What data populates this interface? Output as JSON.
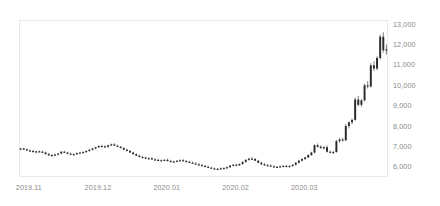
{
  "chart_data": {
    "type": "candlestick",
    "title": "",
    "subtitle": "",
    "xlabel": "",
    "ylabel": "",
    "grid": false,
    "legend": "none",
    "ylim": [
      5500,
      13200
    ],
    "y_ticks": [
      6000,
      7000,
      8000,
      9000,
      10000,
      11000,
      12000,
      13000
    ],
    "y_tick_labels": [
      "6,000",
      "7,000",
      "8,000",
      "9,000",
      "10,000",
      "11,000",
      "12,000",
      "13,000"
    ],
    "y_axis_position": "right",
    "x_tick_labels": [
      "2019.11",
      "2019.12",
      "2020.01",
      "2020.02",
      "2020.03"
    ],
    "x_tick_indices": [
      2,
      24,
      46,
      68,
      90
    ],
    "series_name": "price",
    "candle_color": "#2b2b2b",
    "background_color": "#ffffff",
    "border_color": "#e8e8e8",
    "tick_label_color": "#8a8a8a",
    "ohlc": [
      [
        6870,
        6920,
        6810,
        6900
      ],
      [
        6900,
        6940,
        6830,
        6860
      ],
      [
        6860,
        6890,
        6780,
        6800
      ],
      [
        6800,
        6850,
        6740,
        6780
      ],
      [
        6780,
        6820,
        6700,
        6720
      ],
      [
        6720,
        6780,
        6660,
        6760
      ],
      [
        6760,
        6800,
        6700,
        6740
      ],
      [
        6740,
        6790,
        6680,
        6700
      ],
      [
        6700,
        6740,
        6600,
        6620
      ],
      [
        6620,
        6680,
        6540,
        6560
      ],
      [
        6560,
        6620,
        6500,
        6580
      ],
      [
        6580,
        6650,
        6520,
        6600
      ],
      [
        6600,
        6680,
        6560,
        6650
      ],
      [
        6650,
        6760,
        6620,
        6740
      ],
      [
        6740,
        6790,
        6680,
        6700
      ],
      [
        6700,
        6740,
        6620,
        6640
      ],
      [
        6640,
        6700,
        6580,
        6600
      ],
      [
        6600,
        6660,
        6560,
        6620
      ],
      [
        6620,
        6700,
        6580,
        6680
      ],
      [
        6680,
        6740,
        6640,
        6700
      ],
      [
        6700,
        6760,
        6660,
        6720
      ],
      [
        6720,
        6800,
        6680,
        6780
      ],
      [
        6780,
        6860,
        6740,
        6840
      ],
      [
        6840,
        6920,
        6800,
        6900
      ],
      [
        6900,
        6980,
        6860,
        6960
      ],
      [
        6960,
        7060,
        6920,
        7020
      ],
      [
        7020,
        7080,
        6960,
        7000
      ],
      [
        7000,
        7060,
        6940,
        6980
      ],
      [
        6980,
        7080,
        6940,
        7060
      ],
      [
        7060,
        7140,
        7020,
        7100
      ],
      [
        7100,
        7160,
        7020,
        7040
      ],
      [
        7040,
        7080,
        6960,
        6980
      ],
      [
        6980,
        7020,
        6900,
        6920
      ],
      [
        6920,
        6960,
        6820,
        6840
      ],
      [
        6840,
        6880,
        6760,
        6780
      ],
      [
        6780,
        6820,
        6680,
        6700
      ],
      [
        6700,
        6740,
        6600,
        6620
      ],
      [
        6620,
        6660,
        6520,
        6540
      ],
      [
        6540,
        6600,
        6460,
        6480
      ],
      [
        6480,
        6540,
        6420,
        6460
      ],
      [
        6460,
        6500,
        6380,
        6400
      ],
      [
        6400,
        6460,
        6360,
        6420
      ],
      [
        6420,
        6460,
        6340,
        6360
      ],
      [
        6360,
        6420,
        6300,
        6340
      ],
      [
        6340,
        6400,
        6280,
        6300
      ],
      [
        6300,
        6360,
        6260,
        6320
      ],
      [
        6320,
        6380,
        6280,
        6340
      ],
      [
        6340,
        6400,
        6260,
        6280
      ],
      [
        6280,
        6340,
        6220,
        6240
      ],
      [
        6240,
        6300,
        6200,
        6260
      ],
      [
        6260,
        6320,
        6220,
        6300
      ],
      [
        6300,
        6360,
        6260,
        6320
      ],
      [
        6320,
        6380,
        6260,
        6280
      ],
      [
        6280,
        6340,
        6220,
        6240
      ],
      [
        6240,
        6300,
        6180,
        6200
      ],
      [
        6200,
        6260,
        6140,
        6160
      ],
      [
        6160,
        6220,
        6100,
        6120
      ],
      [
        6120,
        6180,
        6060,
        6080
      ],
      [
        6080,
        6140,
        6020,
        6040
      ],
      [
        6040,
        6100,
        5980,
        6000
      ],
      [
        6000,
        6060,
        5940,
        5960
      ],
      [
        5960,
        6000,
        5900,
        5920
      ],
      [
        5920,
        5960,
        5860,
        5880
      ],
      [
        5880,
        5940,
        5840,
        5900
      ],
      [
        5900,
        5960,
        5860,
        5920
      ],
      [
        5920,
        5980,
        5880,
        5940
      ],
      [
        5940,
        6020,
        5900,
        5980
      ],
      [
        5980,
        6080,
        5940,
        6060
      ],
      [
        6060,
        6140,
        6020,
        6100
      ],
      [
        6100,
        6160,
        6040,
        6080
      ],
      [
        6080,
        6160,
        6040,
        6140
      ],
      [
        6140,
        6260,
        6100,
        6240
      ],
      [
        6240,
        6360,
        6200,
        6340
      ],
      [
        6340,
        6440,
        6300,
        6400
      ],
      [
        6400,
        6480,
        6340,
        6380
      ],
      [
        6380,
        6440,
        6280,
        6300
      ],
      [
        6300,
        6340,
        6180,
        6200
      ],
      [
        6200,
        6240,
        6100,
        6120
      ],
      [
        6120,
        6180,
        6060,
        6080
      ],
      [
        6080,
        6140,
        6020,
        6060
      ],
      [
        6060,
        6120,
        6000,
        6020
      ],
      [
        6020,
        6080,
        5960,
        5980
      ],
      [
        5980,
        6040,
        5940,
        6000
      ],
      [
        6000,
        6060,
        5960,
        6020
      ],
      [
        6020,
        6080,
        5980,
        6040
      ],
      [
        6040,
        6100,
        5980,
        6000
      ],
      [
        6000,
        6080,
        5960,
        6040
      ],
      [
        6040,
        6140,
        6000,
        6100
      ],
      [
        6100,
        6240,
        6060,
        6200
      ],
      [
        6200,
        6340,
        6160,
        6300
      ],
      [
        6300,
        6420,
        6260,
        6380
      ],
      [
        6380,
        6500,
        6340,
        6460
      ],
      [
        6460,
        6620,
        6420,
        6580
      ],
      [
        6580,
        6740,
        6540,
        6700
      ],
      [
        6700,
        7100,
        6660,
        7060
      ],
      [
        7060,
        7140,
        6940,
        6980
      ],
      [
        6980,
        7060,
        6880,
        6920
      ],
      [
        6920,
        7020,
        6840,
        6960
      ],
      [
        6960,
        7040,
        6700,
        6740
      ],
      [
        6740,
        6800,
        6660,
        6700
      ],
      [
        6700,
        6780,
        6640,
        6720
      ],
      [
        6720,
        7320,
        6700,
        7260
      ],
      [
        7260,
        7400,
        7180,
        7340
      ],
      [
        7340,
        7420,
        7240,
        7300
      ],
      [
        7300,
        8100,
        7260,
        8000
      ],
      [
        8000,
        8240,
        7880,
        8180
      ],
      [
        8180,
        8360,
        8080,
        8300
      ],
      [
        8300,
        9400,
        8260,
        9300
      ],
      [
        9300,
        9480,
        8960,
        9040
      ],
      [
        9040,
        9320,
        8940,
        9260
      ],
      [
        9260,
        10080,
        9200,
        10000
      ],
      [
        10000,
        10200,
        9840,
        9940
      ],
      [
        9940,
        11080,
        9900,
        10980
      ],
      [
        10980,
        11180,
        10700,
        10820
      ],
      [
        10820,
        11420,
        10740,
        11340
      ],
      [
        11340,
        12480,
        11260,
        12380
      ],
      [
        12380,
        12600,
        11600,
        11720
      ],
      [
        11720,
        12000,
        11500,
        11760
      ]
    ]
  }
}
